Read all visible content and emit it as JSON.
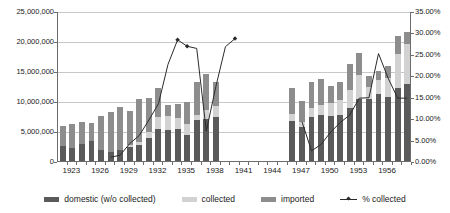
{
  "chart_data": {
    "type": "bar",
    "title": "",
    "subtitle": "",
    "xlabel": "",
    "ylabel": "",
    "y2label": "",
    "grid": true,
    "legend_position": "bottom",
    "ylim": [
      0,
      25000000
    ],
    "y2lim": [
      0,
      0.35
    ],
    "ytick_labels": [
      "0",
      "5,000,000",
      "10,000,000",
      "15,000,000",
      "20,000,000",
      "25,000,000"
    ],
    "ytick_values": [
      0,
      5000000,
      10000000,
      15000000,
      20000000,
      25000000
    ],
    "y2tick_labels": [
      "0.00%",
      "5.00%",
      "10.00%",
      "15.00%",
      "20.00%",
      "25.00%",
      "30.00%",
      "35.00%"
    ],
    "y2tick_values": [
      0,
      5,
      10,
      15,
      20,
      25,
      30,
      35
    ],
    "categories": [
      1922,
      1923,
      1924,
      1925,
      1926,
      1927,
      1928,
      1929,
      1930,
      1931,
      1932,
      1933,
      1934,
      1935,
      1936,
      1937,
      1938,
      1939,
      1940,
      1941,
      1942,
      1943,
      1944,
      1945,
      1946,
      1947,
      1948,
      1949,
      1950,
      1951,
      1952,
      1953,
      1954,
      1955,
      1956,
      1957,
      1958
    ],
    "xtick_labels": [
      "1923",
      "1926",
      "1929",
      "1932",
      "1935",
      "1938",
      "1941",
      "1944",
      "1947",
      "1950",
      "1953",
      "1956"
    ],
    "xtick_values": [
      1923,
      1926,
      1929,
      1932,
      1935,
      1938,
      1941,
      1944,
      1947,
      1950,
      1953,
      1956
    ],
    "series": [
      {
        "name": "domestic (w/o collected)",
        "color": "#5a5a5a",
        "values": [
          2500000,
          2100000,
          2900000,
          3300000,
          1900000,
          1500000,
          1900000,
          2300000,
          2600000,
          3800000,
          5400000,
          5200000,
          5400000,
          4400000,
          6800000,
          7000000,
          7300000,
          null,
          null,
          null,
          null,
          null,
          null,
          null,
          6600000,
          5600000,
          7400000,
          7600000,
          7500000,
          7700000,
          8800000,
          10300000,
          10400000,
          11200000,
          10600000,
          12200000,
          12900000
        ]
      },
      {
        "name": "collected",
        "color": "#d2d2d2",
        "values": [
          0,
          0,
          0,
          0,
          0,
          0,
          0,
          300000,
          600000,
          1100000,
          1900000,
          2300000,
          1700000,
          1800000,
          800000,
          1500000,
          1900000,
          null,
          null,
          null,
          null,
          null,
          null,
          null,
          1300000,
          900000,
          1500000,
          1800000,
          2100000,
          2400000,
          3100000,
          4100000,
          2000000,
          2300000,
          3300000,
          5600000,
          6600000
        ]
      },
      {
        "name": "imported",
        "color": "#8d8d8d",
        "values": [
          3400000,
          4000000,
          3600000,
          3100000,
          5600000,
          6600000,
          7100000,
          5700000,
          7200000,
          5600000,
          4800000,
          1900000,
          2400000,
          3700000,
          5500000,
          6000000,
          4000000,
          null,
          null,
          null,
          null,
          null,
          null,
          null,
          4300000,
          3500000,
          4200000,
          4300000,
          2900000,
          3000000,
          4300000,
          3600000,
          1700000,
          1500000,
          1900000,
          3000000,
          2000000
        ]
      }
    ],
    "line_series": {
      "name": "% collected",
      "color": "#2b2b2b",
      "axis": "secondary",
      "values": [
        null,
        null,
        null,
        null,
        null,
        1.1,
        1.6,
        4.3,
        6.2,
        9.8,
        13.6,
        22.8,
        28.5,
        27.0,
        26.5,
        7.2,
        17.6,
        26.9,
        28.8,
        null,
        null,
        null,
        null,
        null,
        null,
        9.4,
        2.6,
        4.1,
        7.0,
        9.2,
        11.0,
        14.9,
        15.0,
        25.3,
        19.6,
        14.9,
        14.9
      ]
    }
  },
  "legend": {
    "items": [
      {
        "label": "domestic (w/o collected)",
        "swatch": "swatch-domestic",
        "icon": "square-swatch-icon"
      },
      {
        "label": "collected",
        "swatch": "swatch-collected",
        "icon": "square-swatch-icon"
      },
      {
        "label": "imported",
        "swatch": "swatch-imported",
        "icon": "square-swatch-icon"
      },
      {
        "label": "% collected",
        "swatch": "swatch-line",
        "icon": "line-marker-icon"
      }
    ]
  }
}
